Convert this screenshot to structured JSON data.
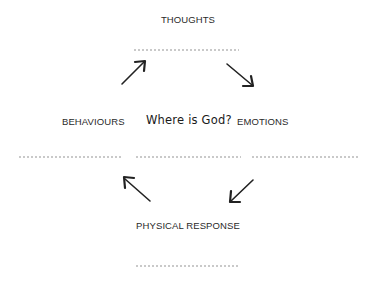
{
  "diagram": {
    "type": "cycle",
    "center_question": "Where is God?",
    "nodes": [
      {
        "id": "thoughts",
        "label": "THOUGHTS",
        "answer_blank": ".........................."
      },
      {
        "id": "emotions",
        "label": "EMOTIONS",
        "answer_blank": ".........................."
      },
      {
        "id": "physical_response",
        "label": "PHYSICAL RESPONSE",
        "answer_blank": ".........................."
      },
      {
        "id": "behaviours",
        "label": "BEHAVIOURS",
        "answer_blank": ".........................."
      }
    ],
    "center_blank": "..........................",
    "arrows": [
      {
        "from": "thoughts",
        "to": "emotions",
        "direction": "down-right"
      },
      {
        "from": "emotions",
        "to": "physical_response",
        "direction": "down-left"
      },
      {
        "from": "physical_response",
        "to": "behaviours",
        "direction": "up-left"
      },
      {
        "from": "behaviours",
        "to": "thoughts",
        "direction": "up-right"
      }
    ],
    "colors": {
      "text": "#2a2a2a",
      "arrow": "#222222",
      "dots": "#8a8a8a",
      "background": "#ffffff"
    }
  }
}
